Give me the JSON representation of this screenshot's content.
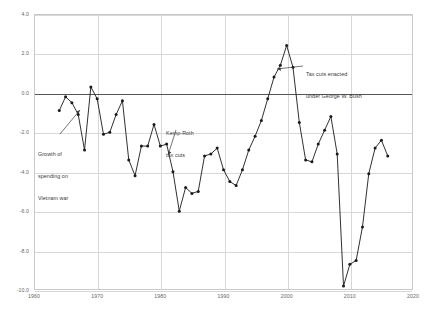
{
  "chart_data": {
    "type": "line",
    "title": "",
    "subtitle": "",
    "xlabel": "",
    "ylabel": "",
    "xlim": [
      1960,
      2020
    ],
    "ylim": [
      -10.0,
      4.0
    ],
    "grid": true,
    "legend_position": "none",
    "marker": "filled-circle",
    "line_color": "#1a1a1a",
    "zero_reference_line": 0.0,
    "x_ticks": [
      1960,
      1970,
      1980,
      1990,
      2000,
      2010,
      2020
    ],
    "x_tick_labels": [
      "1960",
      "1970",
      "1980",
      "1990",
      "2000",
      "2010",
      "2020"
    ],
    "y_ticks": [
      4.0,
      2.0,
      0.0,
      -2.0,
      -4.0,
      -6.0,
      -8.0,
      -10.0
    ],
    "y_tick_labels": [
      "4.0",
      "2.0",
      "0.0",
      "-2.0",
      "-4.0",
      "-6.0",
      "-8.0",
      "-10.0"
    ],
    "x": [
      1964,
      1965,
      1966,
      1967,
      1968,
      1969,
      1970,
      1971,
      1972,
      1973,
      1974,
      1975,
      1976,
      1977,
      1978,
      1979,
      1980,
      1981,
      1982,
      1983,
      1984,
      1985,
      1986,
      1987,
      1988,
      1989,
      1990,
      1991,
      1992,
      1993,
      1994,
      1995,
      1996,
      1997,
      1998,
      1999,
      2000,
      2001,
      2002,
      2003,
      2004,
      2005,
      2006,
      2007,
      2008,
      2009,
      2010,
      2011,
      2012,
      2013,
      2014,
      2015,
      2016
    ],
    "values": [
      -0.9,
      -0.2,
      -0.5,
      -1.1,
      -2.9,
      0.3,
      -0.3,
      -2.1,
      -2.0,
      -1.1,
      -0.4,
      -3.4,
      -4.2,
      -2.7,
      -2.7,
      -1.6,
      -2.7,
      -2.6,
      -4.0,
      -6.0,
      -4.8,
      -5.1,
      -5.0,
      -3.2,
      -3.1,
      -2.8,
      -3.9,
      -4.5,
      -4.7,
      -3.9,
      -2.9,
      -2.2,
      -1.4,
      -0.3,
      0.8,
      1.4,
      2.4,
      1.3,
      -1.5,
      -3.4,
      -3.5,
      -2.6,
      -1.9,
      -1.2,
      -3.1,
      -9.8,
      -8.7,
      -8.5,
      -6.8,
      -4.1,
      -2.8,
      -2.4,
      -3.2
    ],
    "series": [
      {
        "name": "Federal surplus or deficit as percent of GDP",
        "values": [
          -0.9,
          -0.2,
          -0.5,
          -1.1,
          -2.9,
          0.3,
          -0.3,
          -2.1,
          -2.0,
          -1.1,
          -0.4,
          -3.4,
          -4.2,
          -2.7,
          -2.7,
          -1.6,
          -2.7,
          -2.6,
          -4.0,
          -6.0,
          -4.8,
          -5.1,
          -5.0,
          -3.2,
          -3.1,
          -2.8,
          -3.9,
          -4.5,
          -4.7,
          -3.9,
          -2.9,
          -2.2,
          -1.4,
          -0.3,
          0.8,
          1.4,
          2.4,
          1.3,
          -1.5,
          -3.4,
          -3.5,
          -2.6,
          -1.9,
          -1.2,
          -3.1,
          -9.8,
          -8.7,
          -8.5,
          -6.8,
          -4.1,
          -2.8,
          -2.4,
          -3.2
        ]
      }
    ],
    "annotations": [
      {
        "id": "vietnam",
        "text": "Growth of\nspending on\nVietnam war",
        "target_x": 1967,
        "target_y": -1.1,
        "arrow": true
      },
      {
        "id": "kemp-roth",
        "text": "Kemp-Roth\ntax cuts",
        "target_x": 1982,
        "target_y": -4.0,
        "arrow": true
      },
      {
        "id": "bush-tax-cuts",
        "text": "Tax cuts enacted\nunder George W. Bush",
        "target_x": 2001,
        "target_y": 1.3,
        "arrow": true
      }
    ]
  },
  "annotations_text": {
    "vietnam_line1": "Growth of",
    "vietnam_line2": "spending on",
    "vietnam_line3": "Vietnam war",
    "kemp_line1": "Kemp-Roth",
    "kemp_line2": "tax cuts",
    "bush_line1": "Tax cuts enacted",
    "bush_line2": "under George W. Bush"
  }
}
